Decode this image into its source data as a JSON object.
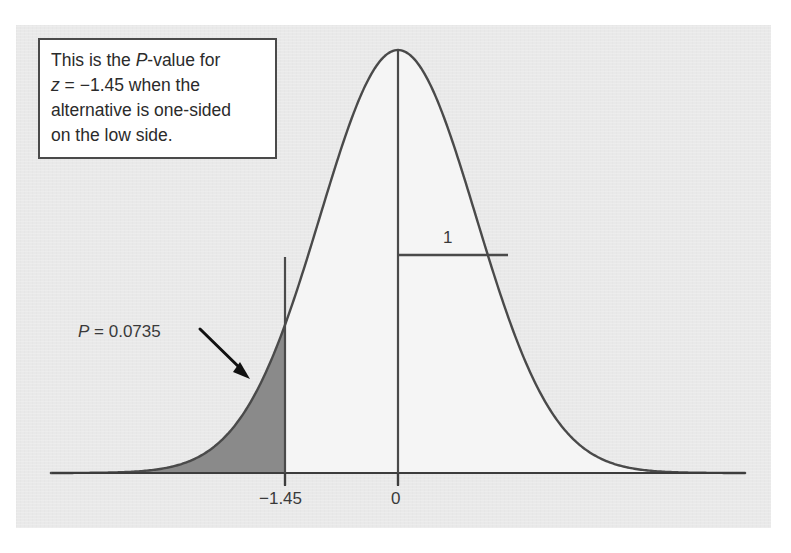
{
  "figure": {
    "background_color": "#e9e9e9",
    "curve_fill_color": "#f5f5f5",
    "tail_fill_color": "#8a8a8a",
    "line_color": "#4a4a4a"
  },
  "callout": {
    "lines": [
      "This is the P-value for",
      "z = −1.45 when the",
      "alternative is one-sided",
      "on the low side."
    ],
    "line1_pre": "This is the ",
    "line1_italic": "P",
    "line1_post": "-value for",
    "line2_italic": "z",
    "line2_post": " = −1.45 when the",
    "line3": "alternative is one-sided",
    "line4": "on the low side."
  },
  "annotations": {
    "p_value_italic": "P",
    "p_value_rest": " = 0.0735",
    "p_value_text": "P = 0.0735",
    "sd_label": "1"
  },
  "axis": {
    "tick_labels": [
      "−1.45",
      "0"
    ],
    "tick_neg": "−1.45",
    "tick_zero": "0"
  },
  "chart_data": {
    "type": "area",
    "title": "",
    "subtitle": "",
    "xlabel": "",
    "ylabel": "",
    "distribution": "standard normal",
    "mean": 0,
    "sd": 1,
    "xlim": [
      -4.45,
      4.45
    ],
    "ylim": [
      0,
      0.3989
    ],
    "grid": false,
    "legend": null,
    "ticks": [
      -1.45,
      0
    ],
    "tick_labels": [
      "−1.45",
      "0"
    ],
    "shaded_region": {
      "from": -4.45,
      "to": -1.45,
      "area": 0.0735,
      "label": "P = 0.0735",
      "fill": "#8a8a8a",
      "tail": "lower"
    },
    "markers": [
      {
        "name": "sd-segment",
        "label": "1",
        "from_x": 0,
        "to_x": 1,
        "y": 0.242
      },
      {
        "name": "center-axis",
        "x": 0
      },
      {
        "name": "cut-line",
        "x": -1.45
      }
    ],
    "annotation_text": "This is the P-value for z = -1.45 when the alternative is one-sided on the low side.",
    "x": [
      -4.45,
      -4.0,
      -3.5,
      -3.0,
      -2.5,
      -2.0,
      -1.45,
      -1.0,
      -0.5,
      0,
      0.5,
      1.0,
      1.45,
      2.0,
      2.5,
      3.0,
      3.5,
      4.0,
      4.45
    ],
    "y": [
      2e-05,
      0.00013,
      0.00087,
      0.00443,
      0.01753,
      0.05399,
      0.13943,
      0.24197,
      0.35207,
      0.39894,
      0.35207,
      0.24197,
      0.13943,
      0.05399,
      0.01753,
      0.00443,
      0.00087,
      0.00013,
      2e-05
    ]
  }
}
